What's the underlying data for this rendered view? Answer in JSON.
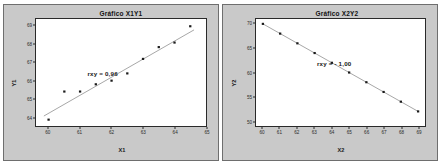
{
  "page": {
    "background_color": "#ffffff",
    "panel_background_color": "#c9c9c9",
    "plot_background_color": "#ffffff",
    "border_color": "#2a2a2a"
  },
  "chart_data": [
    {
      "type": "scatter",
      "id": "grafico-x1y1",
      "title": "Gráfico X1Y1",
      "xlabel": "X1",
      "ylabel": "Y1",
      "annotation": "rxy = 0,96",
      "grid": false,
      "legend": "none",
      "xlim": [
        59.6,
        65.0
      ],
      "ylim": [
        63.5,
        69.4
      ],
      "xticks": [
        60,
        61,
        62,
        63,
        64,
        65
      ],
      "yticks": [
        64,
        65,
        66,
        67,
        68,
        69
      ],
      "xtick_labels": [
        "60",
        "61",
        "62",
        "63",
        "64",
        "65"
      ],
      "ytick_labels": [
        "64",
        "65",
        "66",
        "67",
        "68",
        "69"
      ],
      "x": [
        60.0,
        60.5,
        61.0,
        61.5,
        62.0,
        62.5,
        63.0,
        63.5,
        64.0,
        64.5
      ],
      "y": [
        63.85,
        65.4,
        65.4,
        65.8,
        66.0,
        66.4,
        67.2,
        67.85,
        68.1,
        69.0
      ],
      "trendline": {
        "x0": 59.85,
        "y0": 64.05,
        "x1": 64.62,
        "y1": 68.8,
        "color": "#3a3a3a"
      },
      "marker": {
        "shape": "square",
        "color": "#1a1a1a",
        "size": 2
      }
    },
    {
      "type": "scatter",
      "id": "grafico-x2y2",
      "title": "Gráfico X2Y2",
      "xlabel": "X2",
      "ylabel": "Y2",
      "annotation": "rxy = - 1,00",
      "grid": false,
      "legend": "none",
      "xlim": [
        59.6,
        69.4
      ],
      "ylim": [
        49.0,
        71.0
      ],
      "xticks": [
        60,
        61,
        62,
        63,
        64,
        65,
        66,
        67,
        68,
        69
      ],
      "yticks": [
        50,
        55,
        60,
        65,
        70
      ],
      "xtick_labels": [
        "60",
        "61",
        "62",
        "63",
        "64",
        "65",
        "66",
        "67",
        "68",
        "69"
      ],
      "ytick_labels": [
        "50",
        "55",
        "60",
        "65",
        "70"
      ],
      "x": [
        60,
        61,
        62,
        63,
        64,
        65,
        66,
        67,
        68,
        69
      ],
      "y": [
        70,
        68,
        66,
        64,
        62,
        60,
        58,
        56,
        54,
        52
      ],
      "trendline": {
        "x0": 60,
        "y0": 70,
        "x1": 69,
        "y1": 52,
        "color": "#3a3a3a"
      },
      "marker": {
        "shape": "square",
        "color": "#1a1a1a",
        "size": 2
      }
    }
  ]
}
